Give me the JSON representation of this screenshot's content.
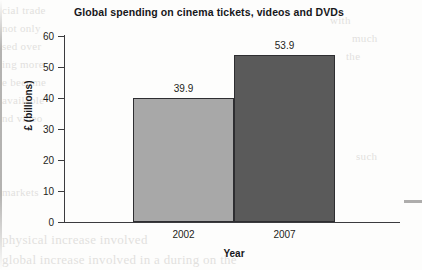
{
  "chart_data": {
    "type": "bar",
    "title": "Global spending on cinema tickets, videos and DVDs",
    "xlabel": "Year",
    "ylabel": "£ (billions)",
    "categories": [
      "2002",
      "2007"
    ],
    "values": [
      39.9,
      53.9
    ],
    "value_labels": [
      "39.9",
      "53.9"
    ],
    "ylim": [
      0,
      60
    ],
    "ytick_step": 10,
    "yticks": [
      "0",
      "10",
      "20",
      "30",
      "40",
      "50",
      "60"
    ],
    "grid": false,
    "legend": false,
    "bar_colors": [
      "#a8a8a8",
      "#5a5a5a"
    ],
    "bar_border_color": "#2e2e31",
    "axis_color": "#3b3b3e",
    "text_color": "#1d1d20",
    "bars_adjacent": true
  },
  "background_text": {
    "left": [
      "cial trade",
      "not only",
      "sed over",
      "ing more",
      "e become",
      "available",
      "nd video",
      "markets",
      "physical increase involved",
      "global increase involved in a during on the"
    ],
    "right": [
      "with",
      "much",
      "the",
      "such"
    ]
  }
}
